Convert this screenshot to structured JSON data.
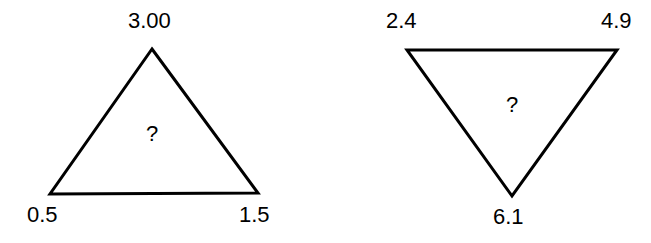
{
  "figure": {
    "background_color": "#ffffff",
    "stroke_color": "#000000",
    "text_color": "#000000",
    "stroke_width": 3,
    "shapes": [
      {
        "name": "left-triangle",
        "orientation": "point-up",
        "points": "152,49 258,193 50,194",
        "center_mark": "?",
        "labels": {
          "apex": "3.00",
          "bottom_left": "0.5",
          "bottom_right": "1.5"
        }
      },
      {
        "name": "right-triangle",
        "orientation": "point-down",
        "points": "407,50 617,50 512,196",
        "center_mark": "?",
        "labels": {
          "top_left": "2.4",
          "top_right": "4.9",
          "bottom": "6.1"
        }
      }
    ]
  }
}
